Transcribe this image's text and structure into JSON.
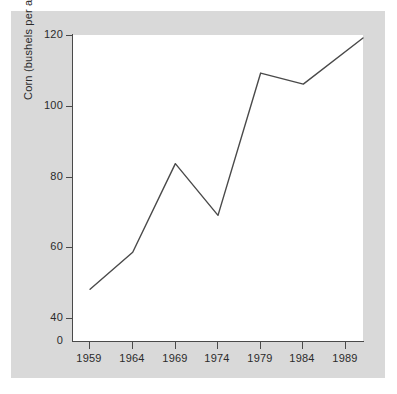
{
  "chart_data": {
    "type": "line",
    "title": "",
    "xlabel": "",
    "ylabel": "Corn (bushels per acre)",
    "x": [
      1959,
      1964,
      1969,
      1974,
      1979,
      1984,
      1991
    ],
    "values": [
      52,
      62,
      86,
      72,
      110.5,
      107.5,
      120
    ],
    "series": [
      {
        "name": "Corn yield",
        "values": [
          52,
          62,
          86,
          72,
          110.5,
          107.5,
          120
        ]
      }
    ],
    "xtick_labels": [
      "1959",
      "1964",
      "1969",
      "1974",
      "1979",
      "1984",
      "1989"
    ],
    "xtick_values": [
      1959,
      1964,
      1969,
      1974,
      1979,
      1984,
      1989
    ],
    "ytick_labels": [
      "0",
      "40",
      "60",
      "80",
      "100",
      "120"
    ],
    "ytick_values": [
      0,
      40,
      60,
      80,
      100,
      120
    ],
    "xlim": [
      1957,
      1991
    ],
    "ylim": [
      38,
      120.8
    ],
    "grid": false,
    "legend": false,
    "line_color": "#4a4a4a",
    "plot_background": "#ffffff",
    "figure_background": "#d9d9d9",
    "axis_color": "#4a4a4a",
    "axis_break": true
  },
  "axis": {
    "y_title": "Corn (bushels per acre)",
    "ticks_y": [
      {
        "label": "120"
      },
      {
        "label": "100"
      },
      {
        "label": "80"
      },
      {
        "label": "60"
      },
      {
        "label": "40"
      },
      {
        "label": "0"
      }
    ],
    "ticks_x": [
      {
        "label": "1959"
      },
      {
        "label": "1964"
      },
      {
        "label": "1969"
      },
      {
        "label": "1974"
      },
      {
        "label": "1979"
      },
      {
        "label": "1984"
      },
      {
        "label": "1989"
      }
    ]
  }
}
